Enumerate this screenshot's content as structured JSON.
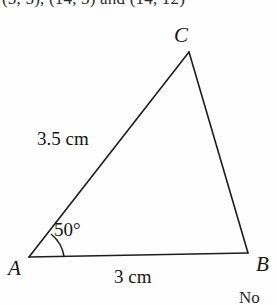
{
  "page": {
    "background_color": "#fefefe",
    "ink_color": "#151515"
  },
  "clipped_text": {
    "top": "(5, 5), (14, 5) and (14, 12)",
    "bottom_right": "No"
  },
  "figure": {
    "type": "triangle-diagram",
    "vertices": [
      {
        "name": "C",
        "label": "C",
        "x": 189,
        "y": 52
      },
      {
        "name": "A",
        "label": "A",
        "x": 29,
        "y": 257
      },
      {
        "name": "B",
        "label": "B",
        "x": 248,
        "y": 253
      }
    ],
    "sides": [
      {
        "name": "side-ac",
        "from": "A",
        "to": "C",
        "label": "3.5 cm"
      },
      {
        "name": "side-ab",
        "from": "A",
        "to": "B",
        "label": "3 cm"
      },
      {
        "name": "side-cb",
        "from": "C",
        "to": "B",
        "label": ""
      }
    ],
    "angles": [
      {
        "name": "angle-a",
        "at": "A",
        "label": "50°",
        "value": 50,
        "unit": "degrees"
      }
    ],
    "stroke_color": "#1d1d1d",
    "stroke_width": 1.6
  }
}
